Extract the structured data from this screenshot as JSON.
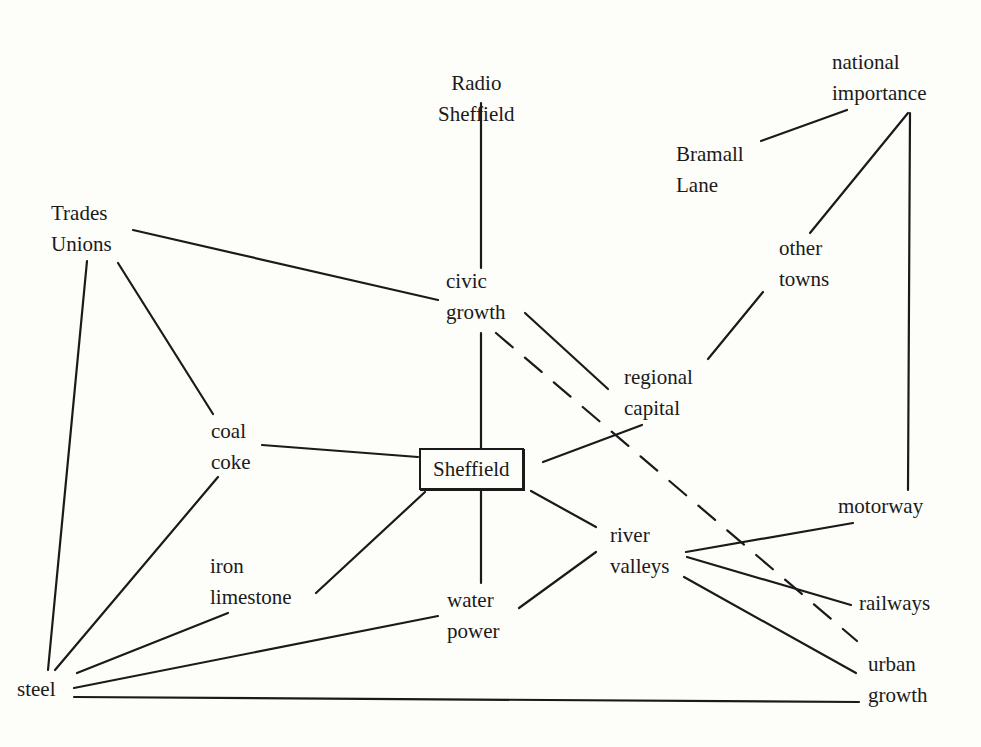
{
  "diagram": {
    "central_node": "sheffield",
    "nodes": [
      {
        "id": "radio-sheffield",
        "lines": [
          "Radio",
          "Sheffield"
        ]
      },
      {
        "id": "national-importance",
        "lines": [
          "national",
          "importance"
        ]
      },
      {
        "id": "bramall-lane",
        "lines": [
          "Bramall",
          "Lane"
        ]
      },
      {
        "id": "trades-unions",
        "lines": [
          "Trades",
          "Unions"
        ]
      },
      {
        "id": "other-towns",
        "lines": [
          "other",
          "towns"
        ]
      },
      {
        "id": "civic-growth",
        "lines": [
          "civic",
          "growth"
        ]
      },
      {
        "id": "regional-capital",
        "lines": [
          "regional",
          "capital"
        ]
      },
      {
        "id": "coal-coke",
        "lines": [
          "coal",
          "coke"
        ]
      },
      {
        "id": "sheffield",
        "lines": [
          "Sheffield"
        ],
        "boxed": true
      },
      {
        "id": "motorway",
        "lines": [
          "motorway"
        ]
      },
      {
        "id": "river-valleys",
        "lines": [
          "river",
          "valleys"
        ]
      },
      {
        "id": "iron-limestone",
        "lines": [
          "iron",
          "limestone"
        ]
      },
      {
        "id": "water-power",
        "lines": [
          "water",
          "power"
        ]
      },
      {
        "id": "railways",
        "lines": [
          "railways"
        ]
      },
      {
        "id": "urban-growth",
        "lines": [
          "urban",
          "growth"
        ]
      },
      {
        "id": "steel",
        "lines": [
          "steel"
        ]
      }
    ],
    "edges": [
      {
        "from": "radio-sheffield",
        "to": "civic-growth",
        "style": "solid"
      },
      {
        "from": "civic-growth",
        "to": "sheffield",
        "style": "solid"
      },
      {
        "from": "sheffield",
        "to": "water-power",
        "style": "solid"
      },
      {
        "from": "trades-unions",
        "to": "civic-growth",
        "style": "solid"
      },
      {
        "from": "trades-unions",
        "to": "steel",
        "style": "solid"
      },
      {
        "from": "trades-unions",
        "to": "coal-coke",
        "style": "solid"
      },
      {
        "from": "coal-coke",
        "to": "sheffield",
        "style": "solid"
      },
      {
        "from": "coal-coke",
        "to": "steel",
        "style": "solid"
      },
      {
        "from": "iron-limestone",
        "to": "steel",
        "style": "solid"
      },
      {
        "from": "sheffield",
        "to": "iron-limestone",
        "style": "solid"
      },
      {
        "from": "water-power",
        "to": "steel",
        "style": "solid"
      },
      {
        "from": "steel",
        "to": "urban-growth",
        "style": "solid"
      },
      {
        "from": "sheffield",
        "to": "regional-capital",
        "style": "solid"
      },
      {
        "from": "sheffield",
        "to": "river-valleys",
        "style": "solid"
      },
      {
        "from": "civic-growth",
        "to": "regional-capital",
        "style": "solid"
      },
      {
        "from": "regional-capital",
        "to": "other-towns",
        "style": "solid"
      },
      {
        "from": "other-towns",
        "to": "national-importance",
        "style": "solid"
      },
      {
        "from": "national-importance",
        "to": "bramall-lane",
        "style": "solid"
      },
      {
        "from": "national-importance",
        "to": "motorway",
        "style": "solid"
      },
      {
        "from": "river-valleys",
        "to": "motorway",
        "style": "solid"
      },
      {
        "from": "river-valleys",
        "to": "railways",
        "style": "solid"
      },
      {
        "from": "river-valleys",
        "to": "urban-growth",
        "style": "solid"
      },
      {
        "from": "water-power",
        "to": "river-valleys",
        "style": "solid"
      },
      {
        "from": "civic-growth",
        "to": "urban-growth",
        "style": "dashed"
      }
    ]
  },
  "colors": {
    "ink": "#1a1a1a",
    "paper": "#fdfdfa"
  }
}
